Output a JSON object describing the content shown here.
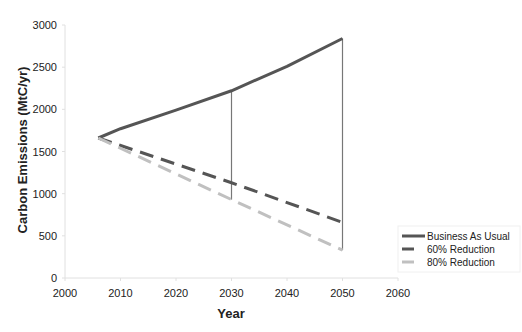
{
  "chart_data": {
    "type": "line",
    "title": "",
    "xlabel": "Year",
    "ylabel": "Carbon Emissions (MtC/yr)",
    "xlim": [
      2000,
      2060
    ],
    "ylim": [
      0,
      3000
    ],
    "x_ticks": [
      "2000",
      "2010",
      "2020",
      "2030",
      "2040",
      "2050",
      "2060"
    ],
    "y_ticks": [
      "0",
      "500",
      "1000",
      "1500",
      "2000",
      "2500",
      "3000"
    ],
    "grid": false,
    "legend_position": "right-bottom",
    "series": [
      {
        "name": "Business As Usual",
        "style": "solid",
        "color": "#555555",
        "x": [
          2006,
          2010,
          2020,
          2030,
          2040,
          2050
        ],
        "values": [
          1660,
          1770,
          1990,
          2220,
          2510,
          2840
        ]
      },
      {
        "name": "60% Reduction",
        "style": "dashed",
        "color": "#555555",
        "x": [
          2006,
          2030,
          2050
        ],
        "values": [
          1660,
          1130,
          660
        ]
      },
      {
        "name": "80% Reduction",
        "style": "dashed",
        "color": "#c0c0c0",
        "x": [
          2006,
          2030,
          2050
        ],
        "values": [
          1660,
          930,
          330
        ]
      }
    ],
    "annotations": [
      {
        "type": "vertical-line",
        "x": 2030,
        "from": 930,
        "to": 2220
      },
      {
        "type": "vertical-line",
        "x": 2050,
        "from": 330,
        "to": 2840
      }
    ]
  },
  "legend": {
    "items": [
      {
        "label": "Business As Usual"
      },
      {
        "label": "60% Reduction"
      },
      {
        "label": "80% Reduction"
      }
    ]
  }
}
